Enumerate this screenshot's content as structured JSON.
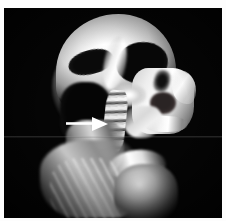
{
  "figure": {
    "type": "medical-image",
    "modality": "3D volume-rendered CT",
    "view": "lateral sagittal",
    "region": "head and neck",
    "background_color": "#050505",
    "border_color": "#ffffff"
  },
  "annotations": [
    {
      "name": "pointer-arrow",
      "shape": "arrow",
      "direction": "right",
      "color": "#ffffff",
      "points_to": "cervical spine",
      "label": ""
    }
  ],
  "anatomy": [
    {
      "name": "cranium",
      "label": "Cranial vault"
    },
    {
      "name": "occiput",
      "label": "Occipital region"
    },
    {
      "name": "temporal-cutaway",
      "label": "Temporal cut-away cavity"
    },
    {
      "name": "orbit-cavity",
      "label": "Orbital cavity"
    },
    {
      "name": "frontal-ridge",
      "label": "Frontal bone ridge"
    },
    {
      "name": "midface",
      "label": "Midface / maxilla"
    },
    {
      "name": "maxillary-sinus",
      "label": "Maxillary sinus"
    },
    {
      "name": "nasal-cavity",
      "label": "Nasal cavity"
    },
    {
      "name": "nasal-profile",
      "label": "Nasal profile"
    },
    {
      "name": "alveolus",
      "label": "Alveolar ridge"
    },
    {
      "name": "mandible",
      "label": "Mandible"
    },
    {
      "name": "skull-base",
      "label": "Skull base"
    },
    {
      "name": "cervical-spine",
      "label": "Cervical spine"
    },
    {
      "name": "neck-muscles",
      "label": "Posterior neck musculature"
    },
    {
      "name": "trapezius",
      "label": "Trapezius"
    },
    {
      "name": "clavicle",
      "label": "Clavicle / acromion"
    },
    {
      "name": "shoulder",
      "label": "Shoulder / humeral head"
    }
  ]
}
